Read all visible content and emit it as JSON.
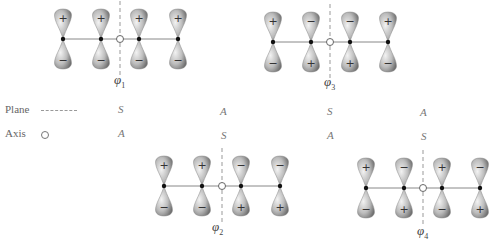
{
  "colors": {
    "lobe_dark": "#7a7a7a",
    "lobe_light": "#e4e4e4",
    "line": "#888888",
    "atom": "#111111"
  },
  "legend": {
    "plane_label": "Plane",
    "axis_label": "Axis"
  },
  "orbitals": [
    {
      "name": "φ1",
      "symbol": "φ",
      "subscript": "1",
      "cx": 120,
      "y": 39,
      "xs": [
        63,
        101,
        139,
        178
      ],
      "top": [
        "+",
        "+",
        "+",
        "+"
      ],
      "bottom": [
        "−",
        "−",
        "−",
        "−"
      ],
      "plane": "S",
      "axis": "A"
    },
    {
      "name": "φ2",
      "symbol": "φ",
      "subscript": "2",
      "cx": 222,
      "y": 186,
      "xs": [
        164,
        202,
        241,
        280
      ],
      "top": [
        "+",
        "+",
        "−",
        "−"
      ],
      "bottom": [
        "−",
        "−",
        "+",
        "+"
      ],
      "plane": "A",
      "axis": "S"
    },
    {
      "name": "φ3",
      "symbol": "φ",
      "subscript": "3",
      "cx": 330,
      "y": 42,
      "xs": [
        273,
        311,
        350,
        388
      ],
      "top": [
        "+",
        "−",
        "−",
        "+"
      ],
      "bottom": [
        "−",
        "+",
        "+",
        "−"
      ],
      "plane": "S",
      "axis": "A"
    },
    {
      "name": "φ4",
      "symbol": "φ",
      "subscript": "4",
      "cx": 423,
      "y": 188,
      "xs": [
        366,
        404,
        442,
        480
      ],
      "top": [
        "+",
        "−",
        "+",
        "−"
      ],
      "bottom": [
        "−",
        "+",
        "−",
        "+"
      ],
      "plane": "A",
      "axis": "S"
    }
  ],
  "symmetry_table": {
    "plane": [
      "S",
      "A",
      "S",
      "A"
    ],
    "axis": [
      "A",
      "S",
      "A",
      "S"
    ],
    "columns_x": [
      121,
      224,
      330,
      424
    ]
  }
}
